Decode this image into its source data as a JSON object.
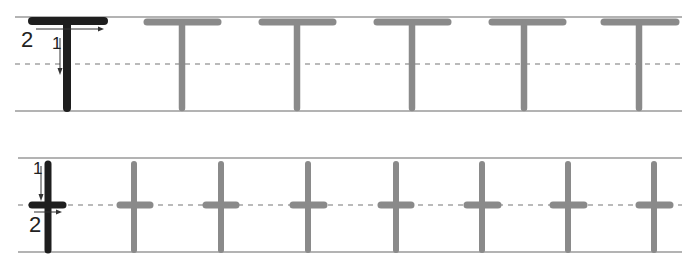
{
  "worksheet": {
    "rows": [
      {
        "name": "row-capital-T",
        "letter": "T",
        "model_color": "#1e1e1e",
        "trace_color": "#8a8a8a",
        "line_color": "#9a9a9a",
        "stroke_order_labels": [
          "1",
          "2"
        ],
        "trace_count": 5
      },
      {
        "name": "row-lowercase-t",
        "letter": "t",
        "model_color": "#1e1e1e",
        "trace_color": "#8a8a8a",
        "line_color": "#9a9a9a",
        "stroke_order_labels": [
          "1",
          "2"
        ],
        "trace_count": 7
      }
    ]
  },
  "labels": {
    "row1_stroke1": "1",
    "row1_stroke2": "2",
    "row2_stroke1": "1",
    "row2_stroke2": "2"
  }
}
